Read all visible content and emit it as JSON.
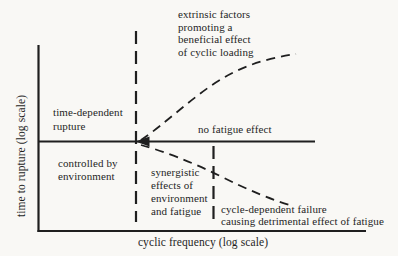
{
  "figure": {
    "colors": {
      "ink": "#1f1f1f",
      "paper": "#f9f8f5"
    },
    "y_axis_label": "time to rupture (log scale)",
    "x_axis_label": "cyclic frequency (log scale)",
    "annotations": {
      "extrinsic": "extrinsic factors\npromoting a\nbeneficial effect\nof cyclic loading",
      "time_dependent": "time-dependent\nrupture",
      "no_fatigue": "no fatigue effect",
      "controlled": "controlled by\nenvironment",
      "synergistic": "synergistic\neffects of\nenvironment\nand fatigue",
      "cycle_dependent": "cycle-dependent failure\ncausing detrimental effect of fatigue"
    },
    "geometry": {
      "y_axis": "M38.5,45 L38.5,232",
      "x_axis": "M37.5,231 L366,231",
      "no_fatigue_line": "M39,141.5 L315,141.5",
      "arrowhead": "M135.5,141.5 L149.5,136.6 L149.5,146.4 Z",
      "vline_left": "M136,31 L136,222",
      "vline_right": "M213.5,146 L213.5,220",
      "beneficial_curve": "M141,140 C162,126 186,103 212,85 C237,68 262,59 296,54",
      "detrimental_curve": "M141,145 C163,151 192,162 220,176 C248,190 272,200 293,206"
    }
  }
}
